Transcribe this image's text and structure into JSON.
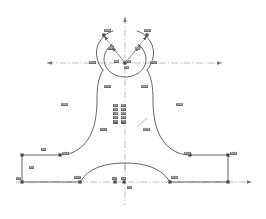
{
  "drawing": {
    "title": "Symmetric fork bracket profile — dimensioned CAD outline",
    "type": "engineering-outline",
    "background_color": "#ffffff",
    "outline_color": "#4a4a4a",
    "centerline_color": "#7a7a7a",
    "node_color": "#4a4a4a",
    "label_color": "#3a3a3a",
    "canvas": {
      "width": 266,
      "height": 219
    }
  },
  "centerlines": {
    "vertical": {
      "x": 125,
      "y1": 17,
      "y2": 205,
      "label": "vertical-axis"
    },
    "horizontal_upper": {
      "y": 63,
      "x1": 47,
      "x2": 222,
      "label": "upper-horizontal-axis"
    },
    "horizontal_lower": {
      "y": 182,
      "x1": 16,
      "x2": 252,
      "label": "lower-horizontal-axis"
    }
  },
  "labels": {
    "fork_left_outer": "R24",
    "fork_right_outer": "R25",
    "fork_left_inner": "R9",
    "fork_right_inner": "R8",
    "fork_left_side": "R11",
    "fork_right_side": "R12",
    "hub_center_left": "R4",
    "hub_center_right": "R5",
    "hub_below": "R6",
    "waist_left_top": "R15",
    "waist_right_top": "R16",
    "waist_left_bottom": "R17",
    "waist_right_bottom": "R18",
    "left_region": "R3a",
    "right_region": "R3b",
    "base_left_top": "R1",
    "base_left_top_right": "R21",
    "base_left_vertical": "R2",
    "base_left_corner": "R0",
    "base_left_inner": "R19",
    "base_right_inner": "R20",
    "base_right_top": "R22",
    "base_right_corner": "R23",
    "arch_peak": "R7",
    "arch_left_foot": "R13",
    "arch_right_foot": "R14",
    "center_node_left": "C1",
    "center_node_right": "C2",
    "center_below": "C3"
  },
  "dimension_stack": {
    "column_left": [
      "D1",
      "D2",
      "D3",
      "D4",
      "D5"
    ],
    "column_right": [
      "E1",
      "E2",
      "E3",
      "E4",
      "E5"
    ]
  }
}
